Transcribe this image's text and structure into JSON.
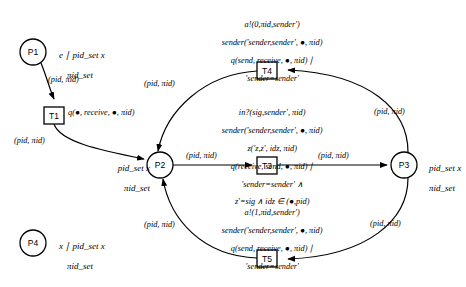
{
  "diagram": {
    "type": "petri-net",
    "title": "",
    "places": [
      {
        "id": "P1",
        "label": "P1",
        "cx": 33,
        "cy": 52,
        "r": 13,
        "annotation_line1": "e ∣ pid_set x",
        "annotation_line2": "πid_set",
        "ann_x": 50,
        "ann_y": 42
      },
      {
        "id": "P2",
        "label": "P2",
        "cx": 160,
        "cy": 165,
        "r": 13,
        "annotation_line1": "pid_set x",
        "annotation_line2": "πid_set",
        "ann_x": 103,
        "ann_y": 155
      },
      {
        "id": "P3",
        "label": "P3",
        "cx": 404,
        "cy": 165,
        "r": 13,
        "annotation_line1": "pid_set x",
        "annotation_line2": "πid_set",
        "ann_x": 421,
        "ann_y": 155
      },
      {
        "id": "P4",
        "label": "P4",
        "cx": 33,
        "cy": 243,
        "r": 13,
        "annotation_line1": "x ∣ pid_set x",
        "annotation_line2": "πid_set",
        "ann_x": 50,
        "ann_y": 233
      }
    ],
    "transitions": [
      {
        "id": "T1",
        "label": "T1",
        "x": 44,
        "y": 107,
        "w": 20,
        "h": 17,
        "guard": "q(●, receive, ●, πid)",
        "guard_x": 69,
        "guard_y": 110,
        "guard_align": "left"
      },
      {
        "id": "T4",
        "label": "T4",
        "x": 257,
        "y": 62,
        "w": 20,
        "h": 17,
        "guard_lines": [
          "a!(0,πid,sender′)",
          "sender(′sender,sender′, ●, πid)",
          "q(send, receive, ●, πid) ∣",
          "′sender=sender′"
        ],
        "guard_x": 267,
        "guard_y": 13
      },
      {
        "id": "T3",
        "label": "T3",
        "x": 257,
        "y": 157,
        "w": 20,
        "h": 17,
        "guard_lines": [
          "in?(sig,sender′, πid)",
          "sender(′sender,sender′, ●, πid)",
          "z(′z,z′, idz, πid)",
          "q(receive, send, ●, πid) ∣",
          "′sender=sender′ ∧",
          "z′=sig ∧ idz ∈ (●,pid)"
        ],
        "guard_x": 267,
        "guard_y": 101
      },
      {
        "id": "T5",
        "label": "T5",
        "x": 257,
        "y": 250,
        "w": 20,
        "h": 17,
        "guard_lines": [
          "a!(1,πid,sender′)",
          "sender(′sender,sender′, ●, πid)",
          "q(send, receive, ●, πid) ∣",
          "′sender=sender′"
        ],
        "guard_x": 267,
        "guard_y": 201
      }
    ],
    "arc_label_text": "(pid, πid)",
    "arcs": [
      {
        "from": "P1",
        "to": "T1",
        "label": "(pid, πid)",
        "lx": 50,
        "ly": 80
      },
      {
        "from": "T1",
        "to": "P2",
        "label": "(pid, πid)",
        "lx": 36,
        "ly": 140
      },
      {
        "from": "P2",
        "to": "T3",
        "label": "(pid, πid)",
        "lx": 190,
        "ly": 152
      },
      {
        "from": "T3",
        "to": "P3",
        "label": "(pid, πid)",
        "lx": 320,
        "ly": 152
      },
      {
        "from": "P3",
        "to": "T4",
        "label": "(pid, πid)",
        "lx": 374,
        "ly": 110
      },
      {
        "from": "T4",
        "to": "P2",
        "label": "(pid, πid)",
        "lx": 148,
        "ly": 82
      },
      {
        "from": "P3",
        "to": "T5",
        "label": "(pid, πid)",
        "lx": 372,
        "ly": 222
      },
      {
        "from": "T5",
        "to": "P2",
        "label": "(pid, πid)",
        "lx": 148,
        "ly": 223
      }
    ]
  },
  "colors": {
    "stroke": "#000000",
    "background": "#ffffff",
    "text": "#000000"
  }
}
